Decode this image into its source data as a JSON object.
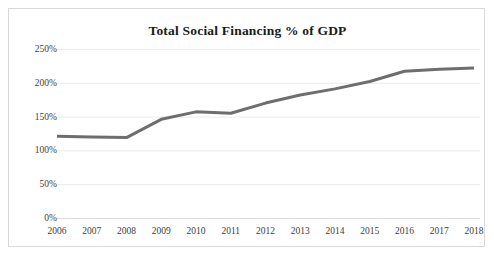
{
  "chart_data": {
    "type": "line",
    "title": "Total Social Financing % of GDP",
    "xlabel": "",
    "ylabel": "",
    "categories": [
      "2006",
      "2007",
      "2008",
      "2009",
      "2010",
      "2011",
      "2012",
      "2013",
      "2014",
      "2015",
      "2016",
      "2017",
      "2018"
    ],
    "values": [
      121,
      120,
      119,
      146,
      157,
      155,
      170,
      182,
      191,
      202,
      217,
      220,
      222
    ],
    "series": [
      {
        "name": "Total Social Financing % of GDP",
        "values": [
          121,
          120,
          119,
          146,
          157,
          155,
          170,
          182,
          191,
          202,
          217,
          220,
          222
        ]
      }
    ],
    "ylim": [
      0,
      250
    ],
    "ytick_values": [
      0,
      50,
      100,
      150,
      200,
      250
    ],
    "ytick_labels": [
      "0%",
      "50%",
      "100%",
      "150%",
      "200%",
      "250%"
    ],
    "grid": true,
    "legend": false,
    "legend_position": "none",
    "line_color": "#6e6e6e",
    "line_width": 3,
    "grid_color": "#eceaea",
    "border_color": "#d9d9d9",
    "background": "#ffffff",
    "text_color": "#3d3d3d",
    "title_color": "#1a1a1a"
  }
}
